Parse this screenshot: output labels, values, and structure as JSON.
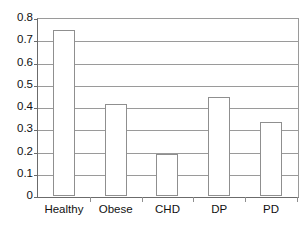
{
  "chart_data": {
    "type": "bar",
    "title": "",
    "subtitle": "",
    "xlabel": "",
    "ylabel": "",
    "categories": [
      "Healthy",
      "Obese",
      "CHD",
      "DP",
      "PD"
    ],
    "values": [
      0.745,
      0.413,
      0.19,
      0.445,
      0.332
    ],
    "ylim": [
      0,
      0.8
    ],
    "ytick_values": [
      0,
      0.1,
      0.2,
      0.3,
      0.4,
      0.5,
      0.6,
      0.7,
      0.8
    ],
    "ytick_labels": [
      "0",
      "0.1",
      "0.2",
      "0.3",
      "0.4",
      "0.5",
      "0.6",
      "0.7",
      "0.8"
    ],
    "grid": true,
    "grid_axis": "y",
    "legend": false,
    "legend_position": "none",
    "series": [
      {
        "name": "",
        "values": [
          0.745,
          0.413,
          0.19,
          0.445,
          0.332
        ]
      }
    ],
    "annotations": [],
    "colors": {
      "bar_fill": "#ffffff",
      "bar_border": "#8f8f8f",
      "gridline": "#9a9a9a",
      "axis": "#6b6b6b",
      "text": "#111111",
      "background": "#ffffff"
    }
  }
}
